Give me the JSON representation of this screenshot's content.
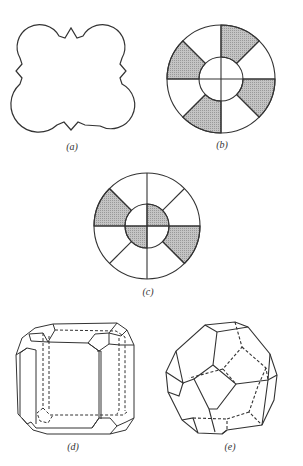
{
  "figure": {
    "panels": [
      {
        "id": "a",
        "label": "(a)",
        "description": "Square outline with four rounded (scalloped) corner lobes joined by zigzag edges at each side midpoint"
      },
      {
        "id": "b",
        "label": "(b)",
        "description": "Annulus divided into 8 sectors with alternate outer sectors shaded; inner circle divided into 4 unshaded quadrants"
      },
      {
        "id": "c",
        "label": "(c)",
        "description": "Annulus divided into 8 sectors with two outer sectors shaded; inner circle quadrants with two shaded"
      },
      {
        "id": "d",
        "label": "(d)",
        "description": "Truncated cube-like crystal with chamfered edges and corner facets, hidden edges dashed"
      },
      {
        "id": "e",
        "label": "(e)",
        "description": "Truncated octahedron polyhedron with hidden edges dashed"
      }
    ]
  },
  "colors": {
    "line": "#333333",
    "shade": "#b8b8b8",
    "background": "#ffffff"
  }
}
